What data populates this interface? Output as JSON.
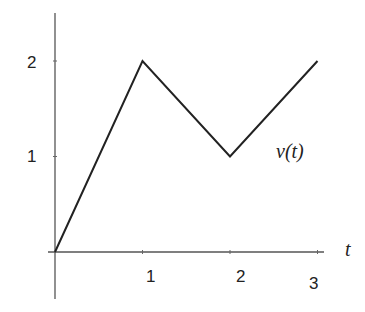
{
  "chart_data": {
    "type": "line",
    "title": "",
    "xlabel": "t",
    "ylabel": "",
    "series": [
      {
        "name": "v(t)",
        "x": [
          0,
          1,
          2,
          3
        ],
        "values": [
          0,
          2,
          1,
          2
        ]
      }
    ],
    "annotations": [
      {
        "text": "v(t)",
        "x": 2.6,
        "y": 1.05
      }
    ],
    "x_ticks": [
      1,
      2,
      3
    ],
    "x_tick_labels": [
      "1",
      "2",
      "3"
    ],
    "y_ticks": [
      1,
      2
    ],
    "y_tick_labels": [
      "1",
      "2"
    ],
    "xlim": [
      -0.08,
      3.05
    ],
    "ylim": [
      -0.5,
      2.5
    ],
    "grid": false,
    "legend": "none"
  },
  "labels": {
    "x_axis_label": "t",
    "curve_label": "v(t)",
    "x_tick_1": "1",
    "x_tick_2": "2",
    "x_tick_3": "3",
    "y_tick_1": "1",
    "y_tick_2": "2"
  },
  "colors": {
    "line": "#222222",
    "axis": "#555555",
    "background": "#ffffff"
  }
}
